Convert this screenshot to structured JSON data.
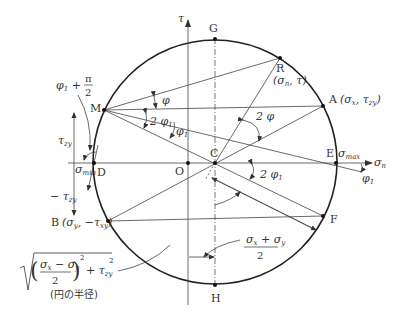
{
  "diagram": {
    "axes": {
      "horizontal": {
        "label": "σ",
        "sub": "n"
      },
      "vertical": {
        "label": "τ"
      }
    },
    "points": {
      "G": "G",
      "H": "H",
      "C": "C",
      "O": "O",
      "D": "D",
      "E": "E",
      "F": "F",
      "M": "M",
      "R": "R",
      "A": "A",
      "B": "B"
    },
    "coords": {
      "R": "(σn, τ)",
      "A": "(σx, τzy)",
      "B": "(σy, −τxy)"
    },
    "labels": {
      "sigma_max": "σmax",
      "sigma_min": "σmin",
      "tau_zy": "τzy",
      "neg_tau_zy": "−τzy",
      "phi": "φ",
      "phi1": "φ1",
      "two_phi": "2 φ",
      "two_phi1": "2 φ1",
      "phi1_plus_pi_over_2": "φ1 + π/2",
      "center_formula_num": "σx + σy",
      "center_formula_den": "2",
      "radius_formula": "√(((σx − σy)/2)² + τzy²)",
      "radius_caption": "(円の半径)"
    }
  }
}
